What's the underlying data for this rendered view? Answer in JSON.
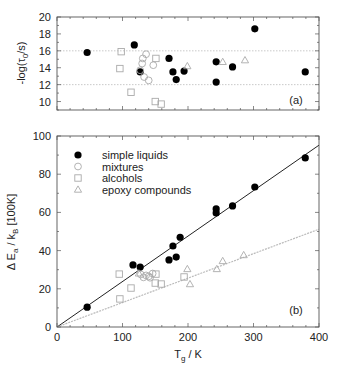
{
  "chart_data": [
    {
      "panel": "(a)",
      "type": "scatter",
      "title": "",
      "xlabel": "",
      "ylabel": "-log(τ0/s)",
      "xlim": [
        0,
        400
      ],
      "ylim": [
        9,
        20
      ],
      "yticks": [
        10,
        12,
        14,
        16,
        18,
        20
      ],
      "xticks": [
        0,
        100,
        200,
        300,
        400
      ],
      "x_tick_labels_shown": false,
      "reference_lines": [
        {
          "y": 16,
          "style": "dotted",
          "color": "#bbbbbb"
        },
        {
          "y": 12,
          "style": "dotted",
          "color": "#bbbbbb"
        }
      ],
      "annotation": "(a)",
      "series": [
        {
          "name": "simple liquids",
          "marker": "filled-circle",
          "color": "#000000",
          "points": [
            [
              46,
              15.8
            ],
            [
              118,
              16.7
            ],
            [
              127,
              13.5
            ],
            [
              171,
              15.1
            ],
            [
              177,
              13.5
            ],
            [
              182,
              12.6
            ],
            [
              194,
              13.6
            ],
            [
              243,
              14.7
            ],
            [
              243,
              12.3
            ],
            [
              268,
              14.1
            ],
            [
              302,
              18.6
            ],
            [
              379,
              13.5
            ]
          ]
        },
        {
          "name": "mixtures",
          "marker": "open-circle",
          "color": "#aaaaaa",
          "points": [
            [
              127,
              13.7
            ],
            [
              130,
              14.5
            ],
            [
              131,
              15.1
            ],
            [
              133,
              12.9
            ],
            [
              136,
              15.6
            ],
            [
              140,
              12.5
            ],
            [
              147,
              14.3
            ]
          ]
        },
        {
          "name": "alcohols",
          "marker": "open-square",
          "color": "#aaaaaa",
          "points": [
            [
              96,
              13.9
            ],
            [
              98,
              15.9
            ],
            [
              113,
              11.1
            ],
            [
              150,
              10.0
            ],
            [
              151,
              15.1
            ],
            [
              159,
              9.7
            ]
          ]
        },
        {
          "name": "epoxy compounds",
          "marker": "open-triangle",
          "color": "#aaaaaa",
          "points": [
            [
              199,
              14.2
            ],
            [
              253,
              14.7
            ],
            [
              287,
              14.9
            ]
          ]
        }
      ]
    },
    {
      "panel": "(b)",
      "type": "scatter",
      "title": "",
      "xlabel": "Tg / K",
      "ylabel": "Δ Ea / kB [100K]",
      "xlim": [
        0,
        400
      ],
      "ylim": [
        0,
        100
      ],
      "xticks": [
        0,
        100,
        200,
        300,
        400
      ],
      "yticks": [
        0,
        20,
        40,
        60,
        80,
        100
      ],
      "annotation": "(b)",
      "legend": {
        "position": "upper-left",
        "entries": [
          "simple liquids",
          "mixtures",
          "alcohols",
          "epoxy compounds"
        ]
      },
      "fit_lines": [
        {
          "name": "simple liquids fit",
          "slope": 0.238,
          "intercept": 0,
          "color": "#222222",
          "style": "solid"
        },
        {
          "name": "others fit",
          "slope": 0.128,
          "intercept": 0,
          "color": "#bbbbbb",
          "style": "dotted"
        }
      ],
      "series": [
        {
          "name": "simple liquids",
          "marker": "filled-circle",
          "color": "#000000",
          "points": [
            [
              46,
              10.4
            ],
            [
              116,
              32.5
            ],
            [
              127,
              31.4
            ],
            [
              171,
              35.1
            ],
            [
              177,
              42.4
            ],
            [
              182,
              36.6
            ],
            [
              188,
              47.0
            ],
            [
              243,
              61.8
            ],
            [
              243,
              59.7
            ],
            [
              268,
              63.4
            ],
            [
              302,
              73.3
            ],
            [
              379,
              88.5
            ]
          ]
        },
        {
          "name": "mixtures",
          "marker": "open-circle",
          "color": "#aaaaaa",
          "points": [
            [
              128,
              27.5
            ],
            [
              132,
              26.0
            ],
            [
              136,
              27.0
            ],
            [
              140,
              26.5
            ],
            [
              146,
              28.0
            ],
            [
              142,
              25.8
            ]
          ]
        },
        {
          "name": "alcohols",
          "marker": "open-square",
          "color": "#aaaaaa",
          "points": [
            [
              95,
              27.7
            ],
            [
              96,
              14.7
            ],
            [
              113,
              20.4
            ],
            [
              150,
              23.0
            ],
            [
              151,
              27.7
            ],
            [
              159,
              22.5
            ],
            [
              194,
              26.2
            ]
          ]
        },
        {
          "name": "epoxy compounds",
          "marker": "open-triangle",
          "color": "#aaaaaa",
          "points": [
            [
              125,
              28.1
            ],
            [
              199,
              30.4
            ],
            [
              203,
              22.5
            ],
            [
              244,
              30.4
            ],
            [
              253,
              34.6
            ],
            [
              285,
              37.7
            ]
          ]
        }
      ]
    }
  ],
  "labels": {
    "top_ylabel_main": "-log(τ",
    "top_ylabel_sub": "0",
    "top_ylabel_end": "/s)",
    "bottom_ylabel_main": "Δ E",
    "bottom_ylabel_sub1": "a",
    "bottom_ylabel_mid": " / k",
    "bottom_ylabel_sub2": "B",
    "bottom_ylabel_end": " [100K]",
    "xlabel_main": "T",
    "xlabel_sub": "g",
    "xlabel_end": " / K",
    "panel_a": "(a)",
    "panel_b": "(b)"
  }
}
